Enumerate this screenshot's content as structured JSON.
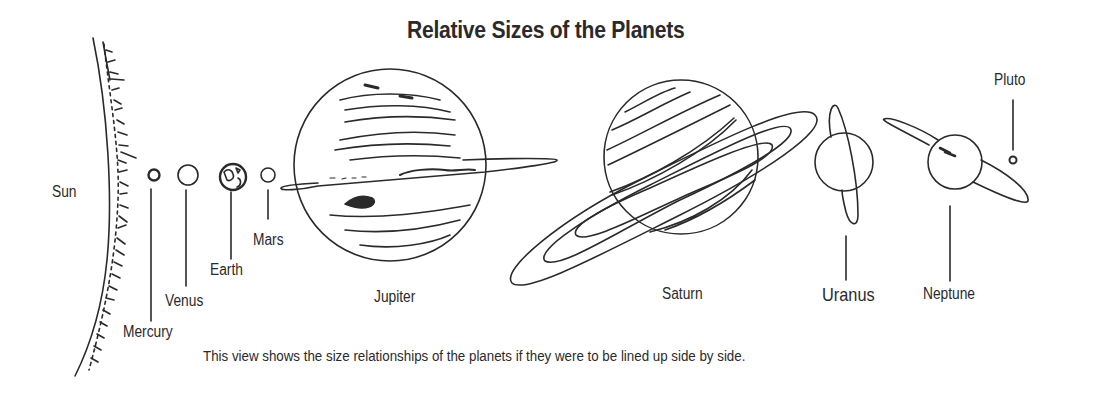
{
  "title": "Relative Sizes of the Planets",
  "caption": "This view shows the size relationships of the planets if they were to be lined up side by side.",
  "bodies": [
    {
      "name": "Sun",
      "label": "Sun"
    },
    {
      "name": "Mercury",
      "label": "Mercury"
    },
    {
      "name": "Venus",
      "label": "Venus"
    },
    {
      "name": "Earth",
      "label": "Earth"
    },
    {
      "name": "Mars",
      "label": "Mars"
    },
    {
      "name": "Jupiter",
      "label": "Jupiter"
    },
    {
      "name": "Saturn",
      "label": "Saturn"
    },
    {
      "name": "Uranus",
      "label": "Uranus"
    },
    {
      "name": "Neptune",
      "label": "Neptune"
    },
    {
      "name": "Pluto",
      "label": "Pluto"
    }
  ],
  "colors": {
    "ink": "#2a2a2a",
    "background": "#ffffff"
  }
}
